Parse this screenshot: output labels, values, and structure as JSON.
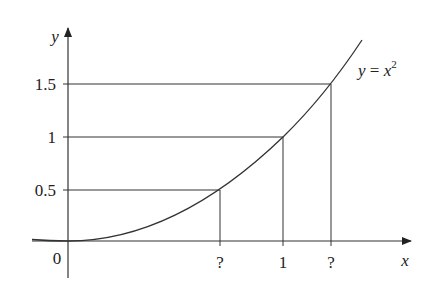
{
  "diagram": {
    "curve_label": {
      "lhs": "y",
      "eq": " = ",
      "base": "x",
      "exp": "2"
    },
    "axes": {
      "x_label": "x",
      "y_label": "y",
      "origin_label": "0"
    },
    "y_ticks": [
      {
        "label": "1.5",
        "value": 1.5
      },
      {
        "label": "1",
        "value": 1
      },
      {
        "label": "0.5",
        "value": 0.5
      }
    ],
    "x_ticks": [
      {
        "label": "?",
        "value": 0.707
      },
      {
        "label": "1",
        "value": 1
      },
      {
        "label": "?",
        "value": 1.225
      }
    ],
    "colors": {
      "line": "#333333",
      "text": "#222222"
    }
  }
}
